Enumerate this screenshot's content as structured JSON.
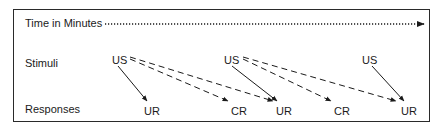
{
  "diagram": {
    "time_axis_label": "Time in Minutes",
    "row_labels": {
      "stimuli": "Stimuli",
      "responses": "Responses"
    },
    "stimuli": [
      {
        "label": "US"
      },
      {
        "label": "US"
      },
      {
        "label": "US"
      }
    ],
    "responses": [
      {
        "label": "UR"
      },
      {
        "label": "CR"
      },
      {
        "label": "UR"
      },
      {
        "label": "CR"
      },
      {
        "label": "UR"
      }
    ],
    "connections": [
      {
        "from": "US 1",
        "to": "UR 1",
        "style": "solid"
      },
      {
        "from": "US 1",
        "to": "CR 1",
        "style": "dashed"
      },
      {
        "from": "US 1",
        "to": "UR 2",
        "style": "dashed"
      },
      {
        "from": "US 2",
        "to": "UR 2",
        "style": "solid"
      },
      {
        "from": "US 2",
        "to": "CR 2",
        "style": "dashed"
      },
      {
        "from": "US 2",
        "to": "UR 3",
        "style": "dashed"
      },
      {
        "from": "US 3",
        "to": "UR 3",
        "style": "solid"
      }
    ],
    "colors": {
      "ink": "#1a1a1a",
      "background": "#ffffff"
    }
  }
}
